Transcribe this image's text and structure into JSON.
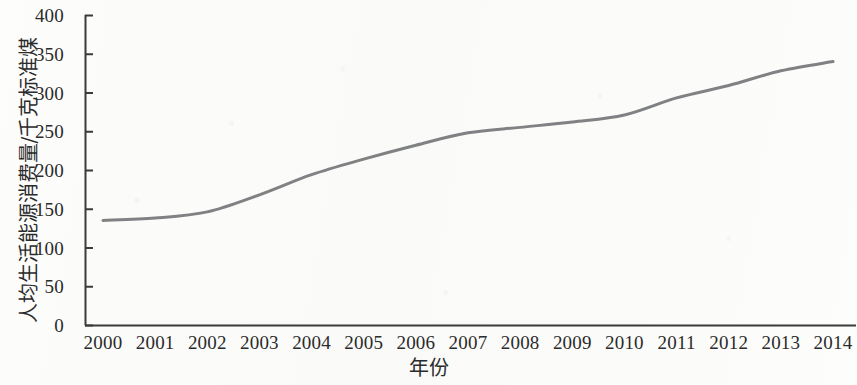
{
  "chart_data": {
    "type": "line",
    "title": "",
    "subtitle": "",
    "xlabel": "年份",
    "ylabel": "人均生活能源消费量/千克标准煤",
    "x": [
      2000,
      2001,
      2002,
      2003,
      2004,
      2005,
      2006,
      2007,
      2008,
      2009,
      2010,
      2011,
      2012,
      2013,
      2014
    ],
    "categories": [
      "2000",
      "2001",
      "2002",
      "2003",
      "2004",
      "2005",
      "2006",
      "2007",
      "2008",
      "2009",
      "2010",
      "2011",
      "2012",
      "2013",
      "2014"
    ],
    "series": [
      {
        "name": "人均生活能源消费量",
        "values": [
          135,
          138,
          146,
          168,
          194,
          214,
          232,
          248,
          255,
          262,
          271,
          293,
          309,
          328,
          340
        ],
        "color": "#7f8183",
        "line_width": 3,
        "marker": "none",
        "smooth": true
      }
    ],
    "values": [
      135,
      138,
      146,
      168,
      194,
      214,
      232,
      248,
      255,
      262,
      271,
      293,
      309,
      328,
      340
    ],
    "ylim": [
      0,
      400
    ],
    "xlim": [
      2000,
      2014
    ],
    "yticks": [
      0,
      50,
      100,
      150,
      200,
      250,
      300,
      350,
      400
    ],
    "ytick_labels": [
      "0",
      "50",
      "100",
      "150",
      "200",
      "250",
      "300",
      "350",
      "400"
    ],
    "xtick_labels": [
      "2000",
      "2001",
      "2002",
      "2003",
      "2004",
      "2005",
      "2006",
      "2007",
      "2008",
      "2009",
      "2010",
      "2011",
      "2012",
      "2013",
      "2014"
    ],
    "grid": false,
    "legend": false,
    "legend_position": "none",
    "axis_color": "#3b3b3b",
    "background_color": "#fdfdfc",
    "y_tick_marks": true,
    "x_tick_marks": false,
    "annotations": []
  }
}
